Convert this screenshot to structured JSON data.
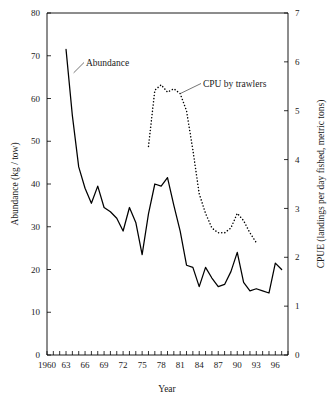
{
  "chart_data": {
    "type": "line",
    "title": "",
    "xlabel": "Year",
    "ylabel": "Abundance (kg / tow)",
    "y2label": "CPUE (landings per day fished, metric tons)",
    "grid": false,
    "legend_position": "inline-annotations",
    "xlim": [
      1960,
      1998
    ],
    "ylim": [
      0,
      80
    ],
    "y2lim": [
      0,
      7
    ],
    "xticks": [
      1960,
      1961,
      1962,
      1963,
      1964,
      1965,
      1966,
      1967,
      1968,
      1969,
      1970,
      1971,
      1972,
      1973,
      1974,
      1975,
      1976,
      1977,
      1978,
      1979,
      1980,
      1981,
      1982,
      1983,
      1984,
      1985,
      1986,
      1987,
      1988,
      1989,
      1990,
      1991,
      1992,
      1993,
      1994,
      1995,
      1996,
      1997,
      1998
    ],
    "xtick_labels": [
      "1960",
      "63",
      "66",
      "69",
      "72",
      "75",
      "78",
      "81",
      "84",
      "87",
      "90",
      "93",
      "96"
    ],
    "xtick_label_values": [
      1960,
      1963,
      1966,
      1969,
      1972,
      1975,
      1978,
      1981,
      1984,
      1987,
      1990,
      1993,
      1996
    ],
    "ytick_labels": [
      "0",
      "10",
      "20",
      "30",
      "40",
      "50",
      "60",
      "70",
      "80"
    ],
    "ytick_values": [
      0,
      10,
      20,
      30,
      40,
      50,
      60,
      70,
      80
    ],
    "y2tick_labels": [
      "0",
      "1",
      "2",
      "3",
      "4",
      "5",
      "6",
      "7"
    ],
    "y2tick_values": [
      0,
      1,
      2,
      3,
      4,
      5,
      6,
      7
    ],
    "series": [
      {
        "name": "Abundance",
        "axis": "left",
        "style": "solid",
        "color": "#000000",
        "x": [
          1963,
          1964,
          1965,
          1966,
          1967,
          1968,
          1969,
          1970,
          1971,
          1972,
          1973,
          1974,
          1975,
          1976,
          1977,
          1978,
          1979,
          1980,
          1981,
          1982,
          1983,
          1984,
          1985,
          1986,
          1987,
          1988,
          1989,
          1990,
          1991,
          1992,
          1993,
          1994,
          1995,
          1996,
          1997
        ],
        "values": [
          71.5,
          56.0,
          44.0,
          39.0,
          35.5,
          39.5,
          34.5,
          33.5,
          32.0,
          29.0,
          34.5,
          31.0,
          23.5,
          33.0,
          40.0,
          39.5,
          41.5,
          35.0,
          29.0,
          21.0,
          20.5,
          16.0,
          20.5,
          18.0,
          16.0,
          16.5,
          19.5,
          24.0,
          17.0,
          15.0,
          15.5,
          15.0,
          14.5,
          21.5,
          20.0
        ]
      },
      {
        "name": "CPU by trawlers",
        "axis": "right",
        "style": "dotted",
        "color": "#000000",
        "x": [
          1976,
          1977,
          1978,
          1979,
          1980,
          1981,
          1982,
          1983,
          1984,
          1985,
          1986,
          1987,
          1988,
          1989,
          1990,
          1991,
          1992,
          1993
        ],
        "values": [
          4.27,
          5.42,
          5.53,
          5.38,
          5.45,
          5.35,
          5.0,
          4.2,
          3.3,
          2.9,
          2.6,
          2.5,
          2.5,
          2.6,
          2.9,
          2.75,
          2.5,
          2.3
        ]
      }
    ],
    "annotations": [
      {
        "text": "Abundance",
        "points_to_series": "Abundance",
        "points_to_x": 1964.2,
        "points_to_y": 66.0
      },
      {
        "text": "CPU by trawlers",
        "points_to_series": "CPU by trawlers",
        "points_to_x": 1981.0,
        "points_to_y": 5.35
      }
    ]
  },
  "axes": {
    "x_title": "Year",
    "y_left_title": "Abundance (kg / tow)",
    "y_right_title": "CPUE (landings per day fished, metric tons)"
  },
  "labels": {
    "abundance": "Abundance",
    "cpu": "CPU by trawlers"
  }
}
